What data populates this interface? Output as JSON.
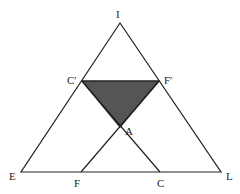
{
  "diagram": {
    "type": "geometric-triangle",
    "points": {
      "I": {
        "label": "I",
        "x": 120,
        "y": 23
      },
      "E": {
        "label": "E",
        "x": 21,
        "y": 172
      },
      "L": {
        "label": "L",
        "x": 221,
        "y": 172
      },
      "C_prime": {
        "label": "C′",
        "x": 82,
        "y": 81
      },
      "F_prime": {
        "label": "F′",
        "x": 159,
        "y": 81
      },
      "A": {
        "label": "A",
        "x": 120,
        "y": 127
      },
      "F": {
        "label": "F",
        "x": 81,
        "y": 172
      },
      "C": {
        "label": "C",
        "x": 160,
        "y": 172
      }
    },
    "shaded_region": [
      "C′",
      "F′",
      "A"
    ],
    "colors": {
      "stroke": "#222222",
      "fill": "#555555",
      "background": "#ffffff"
    }
  }
}
